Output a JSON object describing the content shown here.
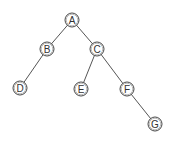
{
  "diagram": {
    "type": "binary-tree",
    "nodes": [
      {
        "id": "A",
        "label": "A",
        "x": 72,
        "y": 20
      },
      {
        "id": "B",
        "label": "B",
        "x": 47,
        "y": 49
      },
      {
        "id": "C",
        "label": "C",
        "x": 97,
        "y": 49
      },
      {
        "id": "D",
        "label": "D",
        "x": 20,
        "y": 88
      },
      {
        "id": "E",
        "label": "E",
        "x": 81,
        "y": 89
      },
      {
        "id": "F",
        "label": "F",
        "x": 127,
        "y": 89
      },
      {
        "id": "G",
        "label": "G",
        "x": 155,
        "y": 124
      }
    ],
    "edges": [
      {
        "from": "A",
        "to": "B"
      },
      {
        "from": "A",
        "to": "C"
      },
      {
        "from": "B",
        "to": "D"
      },
      {
        "from": "C",
        "to": "E"
      },
      {
        "from": "C",
        "to": "F"
      },
      {
        "from": "F",
        "to": "G"
      }
    ],
    "node_radius": 7,
    "colors": {
      "edge": "#555555",
      "node_stroke": "#444444",
      "text": "#333333"
    }
  }
}
